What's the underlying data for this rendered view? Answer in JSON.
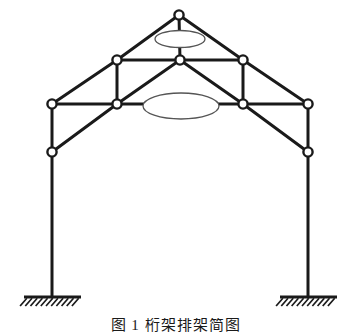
{
  "figure": {
    "kind": "structural-truss-frame-diagram",
    "caption": "图 1  桁架排架简图",
    "background_color": "#ffffff",
    "member_color": "#1a1a1a",
    "node_fill_color": "#ffffff",
    "node_stroke_color": "#1a1a1a",
    "ellipse_stroke_color": "#555555",
    "member_width_px": 3,
    "node_radius_px": 4.6
  },
  "geometry": {
    "nodes": [
      {
        "id": "apex",
        "label": "apex-node",
        "x": 179,
        "y": 15
      },
      {
        "id": "mid_left",
        "label": "upper-left-node",
        "x": 117,
        "y": 60
      },
      {
        "id": "mid_center",
        "label": "upper-center-node",
        "x": 180,
        "y": 60
      },
      {
        "id": "mid_right",
        "label": "upper-right-node",
        "x": 243,
        "y": 60
      },
      {
        "id": "eave_left",
        "label": "left-eave-node",
        "x": 52,
        "y": 104
      },
      {
        "id": "tie_left",
        "label": "left-tie-node",
        "x": 117,
        "y": 104
      },
      {
        "id": "tie_right",
        "label": "right-tie-node",
        "x": 243,
        "y": 104
      },
      {
        "id": "eave_right",
        "label": "right-eave-node",
        "x": 308,
        "y": 104
      },
      {
        "id": "knee_left",
        "label": "left-knee-node",
        "x": 52,
        "y": 152
      },
      {
        "id": "knee_right",
        "label": "right-knee-node",
        "x": 308,
        "y": 152
      },
      {
        "id": "base_left",
        "label": "left-base-point",
        "x": 52,
        "y": 297
      },
      {
        "id": "base_right",
        "label": "right-base-point",
        "x": 308,
        "y": 297
      }
    ],
    "members": [
      {
        "id": "m1",
        "name": "left-upper-rafter",
        "from": "apex",
        "to": "mid_left"
      },
      {
        "id": "m2",
        "name": "left-lower-rafter",
        "from": "mid_left",
        "to": "eave_left"
      },
      {
        "id": "m3",
        "name": "right-upper-rafter",
        "from": "apex",
        "to": "mid_right"
      },
      {
        "id": "m4",
        "name": "right-lower-rafter",
        "from": "mid_right",
        "to": "eave_right"
      },
      {
        "id": "m5",
        "name": "king-post",
        "from": "apex",
        "to": "mid_center"
      },
      {
        "id": "m6",
        "name": "upper-chord-left",
        "from": "mid_left",
        "to": "mid_center"
      },
      {
        "id": "m7",
        "name": "upper-chord-right",
        "from": "mid_center",
        "to": "mid_right"
      },
      {
        "id": "m8",
        "name": "left-post",
        "from": "mid_left",
        "to": "tie_left"
      },
      {
        "id": "m9",
        "name": "right-post",
        "from": "mid_right",
        "to": "tie_right"
      },
      {
        "id": "m10",
        "name": "left-diagonal-brace",
        "from": "mid_center",
        "to": "tie_left"
      },
      {
        "id": "m11",
        "name": "right-diagonal-brace",
        "from": "mid_center",
        "to": "tie_right"
      },
      {
        "id": "m12",
        "name": "tie-beam-left-span",
        "from": "eave_left",
        "to": "tie_left"
      },
      {
        "id": "m13",
        "name": "tie-beam-mid-span",
        "from": "tie_left",
        "to": "tie_right"
      },
      {
        "id": "m14",
        "name": "tie-beam-right-span",
        "from": "tie_right",
        "to": "eave_right"
      },
      {
        "id": "m15",
        "name": "left-knee-brace",
        "from": "tie_left",
        "to": "knee_left"
      },
      {
        "id": "m16",
        "name": "right-knee-brace",
        "from": "tie_right",
        "to": "knee_right"
      },
      {
        "id": "m17",
        "name": "left-column-upper",
        "from": "eave_left",
        "to": "knee_left"
      },
      {
        "id": "m18",
        "name": "right-column-upper",
        "from": "eave_right",
        "to": "knee_right"
      },
      {
        "id": "m19",
        "name": "left-column-lower",
        "from": "knee_left",
        "to": "base_left"
      },
      {
        "id": "m20",
        "name": "right-column-lower",
        "from": "knee_right",
        "to": "base_right"
      }
    ],
    "ellipses": [
      {
        "id": "e1",
        "name": "upper-ellipse-marker",
        "cx": 180,
        "cy": 39,
        "rx": 25,
        "ry": 8.5
      },
      {
        "id": "e2",
        "name": "lower-ellipse-marker",
        "cx": 181,
        "cy": 106,
        "rx": 38,
        "ry": 13
      }
    ],
    "supports": [
      {
        "id": "s1",
        "name": "left-fixed-support",
        "x_start": 24,
        "x_end": 81,
        "y": 297,
        "hatch_count": 11,
        "hatch_length": 9
      },
      {
        "id": "s2",
        "name": "right-fixed-support",
        "x_start": 280,
        "x_end": 337,
        "y": 297,
        "hatch_count": 11,
        "hatch_length": 9
      }
    ]
  }
}
